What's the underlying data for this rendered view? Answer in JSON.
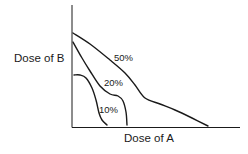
{
  "figure": {
    "type": "isobologram",
    "y_axis_label": "Dose of B",
    "x_axis_label": "Dose of A",
    "curves": [
      {
        "label": "50%",
        "points": [
          [
            73,
            33
          ],
          [
            90,
            44
          ],
          [
            110,
            60
          ],
          [
            125,
            73
          ],
          [
            135,
            85
          ],
          [
            145,
            98
          ],
          [
            160,
            104
          ],
          [
            175,
            110
          ],
          [
            192,
            118
          ],
          [
            208,
            126
          ]
        ]
      },
      {
        "label": "20%",
        "points": [
          [
            73,
            42
          ],
          [
            82,
            58
          ],
          [
            90,
            71
          ],
          [
            100,
            86
          ],
          [
            110,
            94
          ],
          [
            118,
            96
          ],
          [
            123,
            101
          ],
          [
            126,
            112
          ],
          [
            127,
            125
          ]
        ]
      },
      {
        "label": "10%",
        "points": [
          [
            74,
            75
          ],
          [
            80,
            75
          ],
          [
            86,
            78
          ],
          [
            92,
            88
          ],
          [
            96,
            100
          ],
          [
            99,
            113
          ],
          [
            102,
            120
          ],
          [
            107,
            125
          ]
        ]
      }
    ],
    "line_color": "#1a1a1a"
  }
}
